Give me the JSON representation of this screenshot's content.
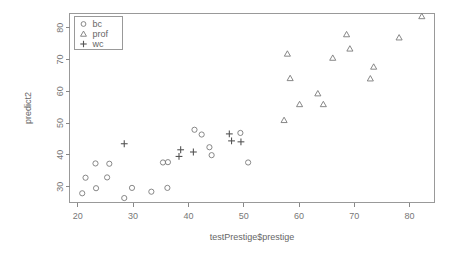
{
  "chart_data": {
    "type": "scatter",
    "title": "",
    "xlabel": "testPrestige$prestige",
    "ylabel": "predict2",
    "xlim": [
      18.5,
      84.5
    ],
    "ylim": [
      25.0,
      84.5
    ],
    "xticks": [
      20,
      30,
      40,
      50,
      60,
      70,
      80
    ],
    "yticks": [
      30,
      40,
      50,
      60,
      70,
      80
    ],
    "grid": false,
    "legend_position": "top-left",
    "series": [
      {
        "name": "bc",
        "marker": "circle",
        "points": [
          [
            20.8,
            27.9
          ],
          [
            21.4,
            32.8
          ],
          [
            23.2,
            37.3
          ],
          [
            23.3,
            29.5
          ],
          [
            25.3,
            32.9
          ],
          [
            25.7,
            37.2
          ],
          [
            28.4,
            26.4
          ],
          [
            29.8,
            29.6
          ],
          [
            33.3,
            28.4
          ],
          [
            35.4,
            37.6
          ],
          [
            36.2,
            29.6
          ],
          [
            36.3,
            37.7
          ],
          [
            41.1,
            47.9
          ],
          [
            42.4,
            46.4
          ],
          [
            43.8,
            42.4
          ],
          [
            44.2,
            39.9
          ],
          [
            49.4,
            46.9
          ],
          [
            50.8,
            37.6
          ]
        ]
      },
      {
        "name": "prof",
        "marker": "triangle",
        "points": [
          [
            57.3,
            50.9
          ],
          [
            57.9,
            71.8
          ],
          [
            58.4,
            64.1
          ],
          [
            60.1,
            55.9
          ],
          [
            63.4,
            59.3
          ],
          [
            64.4,
            55.9
          ],
          [
            66.1,
            70.5
          ],
          [
            68.6,
            77.9
          ],
          [
            69.2,
            73.4
          ],
          [
            72.9,
            64.0
          ],
          [
            73.5,
            67.7
          ],
          [
            78.1,
            76.9
          ],
          [
            82.2,
            83.6
          ]
        ]
      },
      {
        "name": "wc",
        "marker": "plus",
        "points": [
          [
            28.4,
            43.5
          ],
          [
            38.3,
            39.5
          ],
          [
            38.6,
            41.6
          ],
          [
            40.9,
            40.9
          ],
          [
            47.4,
            46.6
          ],
          [
            47.8,
            44.4
          ],
          [
            49.5,
            44.1
          ]
        ]
      }
    ]
  },
  "legend": {
    "entries": [
      {
        "label": "bc",
        "marker": "circle"
      },
      {
        "label": "prof",
        "marker": "triangle"
      },
      {
        "label": "wc",
        "marker": "plus"
      }
    ]
  }
}
